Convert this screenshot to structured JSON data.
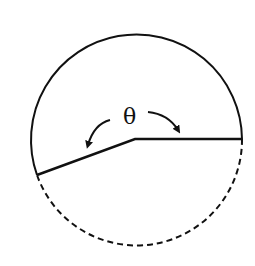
{
  "diagram": {
    "type": "geometry",
    "angle_label": "θ",
    "colors": {
      "stroke": "#111111",
      "background": "#ffffff"
    },
    "circle": {
      "cx": 136.5,
      "cy": 139,
      "r": 105.5
    },
    "vertex": {
      "x": 135,
      "y": 139
    },
    "right_endpoint": {
      "x": 242,
      "y": 139
    },
    "left_endpoint": {
      "x": 37,
      "y": 175
    },
    "arcs": [
      {
        "name": "upper-arc",
        "style": "solid"
      },
      {
        "name": "lower-arc",
        "style": "dashed"
      }
    ],
    "arrows": [
      {
        "name": "left-curved-arrow",
        "direction": "counterclockwise-down-left"
      },
      {
        "name": "right-curved-arrow",
        "direction": "clockwise-down-right"
      }
    ]
  }
}
